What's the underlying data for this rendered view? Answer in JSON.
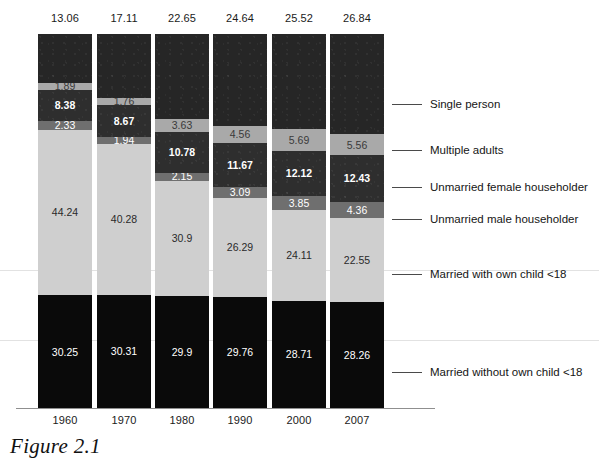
{
  "caption": "Figure 2.1",
  "chart_data": {
    "type": "bar",
    "title": "Figure 2.1",
    "xlabel": "",
    "ylabel": "",
    "ylim": [
      0,
      100
    ],
    "grid": true,
    "legend_position": "right",
    "stacked": true,
    "categories": [
      "1960",
      "1970",
      "1980",
      "1990",
      "2000",
      "2007"
    ],
    "totals_label_note": "Value shown above each bar is the Single person share",
    "totals": [
      "13.06",
      "17.11",
      "22.65",
      "24.64",
      "25.52",
      "26.84"
    ],
    "series": [
      {
        "name": "Single person",
        "color": "#262626",
        "values": [
          13.06,
          17.11,
          22.65,
          24.64,
          25.52,
          26.84
        ],
        "labels": [
          "",
          "",
          "",
          "",
          "",
          ""
        ]
      },
      {
        "name": "Multiple adults",
        "color": "#a9a9a9",
        "values": [
          1.89,
          1.76,
          3.63,
          4.56,
          5.69,
          5.56
        ],
        "labels": [
          "1.89",
          "1.76",
          "3.63",
          "4.56",
          "5.69",
          "5.56"
        ]
      },
      {
        "name": "Unmarried female householder",
        "color": "#2e2e2e",
        "values": [
          8.38,
          8.67,
          10.78,
          11.67,
          12.12,
          12.43
        ],
        "labels": [
          "8.38",
          "8.67",
          "10.78",
          "11.67",
          "12.12",
          "12.43"
        ]
      },
      {
        "name": "Unmarried male householder",
        "color": "#6f6f6f",
        "values": [
          2.33,
          1.94,
          2.15,
          3.09,
          3.85,
          4.36
        ],
        "labels": [
          "2.33",
          "1.94",
          "2.15",
          "3.09",
          "3.85",
          "4.36"
        ]
      },
      {
        "name": "Married with own child <18",
        "color": "#cfcfcf",
        "values": [
          44.24,
          40.28,
          30.9,
          26.29,
          24.11,
          22.55
        ],
        "labels": [
          "44.24",
          "40.28",
          "30.9",
          "26.29",
          "24.11",
          "22.55"
        ]
      },
      {
        "name": "Married without own child <18",
        "color": "#0a0a0a",
        "values": [
          30.25,
          30.31,
          29.9,
          29.76,
          28.71,
          28.26
        ],
        "labels": [
          "30.25",
          "30.31",
          "29.9",
          "29.76",
          "28.71",
          "28.26"
        ]
      }
    ]
  },
  "columns": [
    {
      "year": "1960",
      "total": "13.06",
      "segments": [
        {
          "key": "single",
          "label": "",
          "pct": 13.06
        },
        {
          "key": "multi",
          "label": "1.89",
          "pct": 1.89
        },
        {
          "key": "female",
          "label": "8.38",
          "pct": 8.38
        },
        {
          "key": "male",
          "label": "2.33",
          "pct": 2.33
        },
        {
          "key": "withkid",
          "label": "44.24",
          "pct": 44.24
        },
        {
          "key": "nokid",
          "label": "30.25",
          "pct": 30.25
        }
      ]
    },
    {
      "year": "1970",
      "total": "17.11",
      "segments": [
        {
          "key": "single",
          "label": "",
          "pct": 17.11
        },
        {
          "key": "multi",
          "label": "1.76",
          "pct": 1.76
        },
        {
          "key": "female",
          "label": "8.67",
          "pct": 8.67
        },
        {
          "key": "male",
          "label": "1.94",
          "pct": 1.94
        },
        {
          "key": "withkid",
          "label": "40.28",
          "pct": 40.28
        },
        {
          "key": "nokid",
          "label": "30.31",
          "pct": 30.31
        }
      ]
    },
    {
      "year": "1980",
      "total": "22.65",
      "segments": [
        {
          "key": "single",
          "label": "",
          "pct": 22.65
        },
        {
          "key": "multi",
          "label": "3.63",
          "pct": 3.63
        },
        {
          "key": "female",
          "label": "10.78",
          "pct": 10.78
        },
        {
          "key": "male",
          "label": "2.15",
          "pct": 2.15
        },
        {
          "key": "withkid",
          "label": "30.9",
          "pct": 30.9
        },
        {
          "key": "nokid",
          "label": "29.9",
          "pct": 29.9
        }
      ]
    },
    {
      "year": "1990",
      "total": "24.64",
      "segments": [
        {
          "key": "single",
          "label": "",
          "pct": 24.64
        },
        {
          "key": "multi",
          "label": "4.56",
          "pct": 4.56
        },
        {
          "key": "female",
          "label": "11.67",
          "pct": 11.67
        },
        {
          "key": "male",
          "label": "3.09",
          "pct": 3.09
        },
        {
          "key": "withkid",
          "label": "26.29",
          "pct": 26.29
        },
        {
          "key": "nokid",
          "label": "29.76",
          "pct": 29.76
        }
      ]
    },
    {
      "year": "2000",
      "total": "25.52",
      "segments": [
        {
          "key": "single",
          "label": "",
          "pct": 25.52
        },
        {
          "key": "multi",
          "label": "5.69",
          "pct": 5.69
        },
        {
          "key": "female",
          "label": "12.12",
          "pct": 12.12
        },
        {
          "key": "male",
          "label": "3.85",
          "pct": 3.85
        },
        {
          "key": "withkid",
          "label": "24.11",
          "pct": 24.11
        },
        {
          "key": "nokid",
          "label": "28.71",
          "pct": 28.71
        }
      ]
    },
    {
      "year": "2007",
      "total": "26.84",
      "segments": [
        {
          "key": "single",
          "label": "",
          "pct": 26.84
        },
        {
          "key": "multi",
          "label": "5.56",
          "pct": 5.56
        },
        {
          "key": "female",
          "label": "12.43",
          "pct": 12.43
        },
        {
          "key": "male",
          "label": "4.36",
          "pct": 4.36
        },
        {
          "key": "withkid",
          "label": "22.55",
          "pct": 22.55
        },
        {
          "key": "nokid",
          "label": "28.26",
          "pct": 28.26
        }
      ]
    }
  ],
  "legend": [
    {
      "label": "Single person",
      "top": 97
    },
    {
      "label": "Multiple adults",
      "top": 143
    },
    {
      "label": "Unmarried female householder",
      "top": 180
    },
    {
      "label": "Unmarried male householder",
      "top": 212
    },
    {
      "label": "Married with own child <18",
      "top": 267
    },
    {
      "label": "Married without own child <18",
      "top": 365
    }
  ]
}
